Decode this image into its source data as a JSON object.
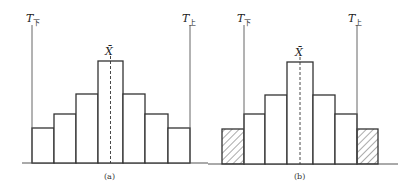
{
  "panels": [
    {
      "id": "a",
      "caption": "(a)",
      "lower_limit_label": {
        "main": "T",
        "sub": "下"
      },
      "upper_limit_label": {
        "main": "T",
        "sub": "上"
      },
      "mean_label": "X̄",
      "bars_relative_heights": [
        35,
        49,
        69,
        102,
        69,
        49,
        35
      ],
      "hatched_bars": []
    },
    {
      "id": "b",
      "caption": "(b)",
      "lower_limit_label": {
        "main": "T",
        "sub": "下"
      },
      "upper_limit_label": {
        "main": "T",
        "sub": "上"
      },
      "mean_label": "X̄",
      "bars_relative_heights": [
        35,
        49,
        69,
        102,
        69,
        49,
        35
      ],
      "hatched_bars": [
        0,
        6
      ]
    }
  ],
  "colors": {
    "stroke": "#333333",
    "limit_line": "#555555",
    "hatch": "#444444"
  }
}
